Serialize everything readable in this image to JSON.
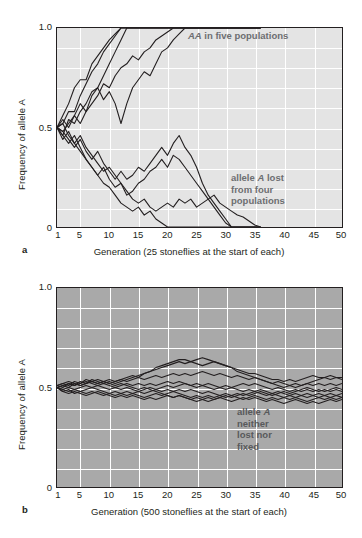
{
  "figure": {
    "panels": [
      {
        "letter": "a",
        "y_axis_label": "Frequency of allele A",
        "y_ticks": [
          "1.0",
          "0.5",
          "0"
        ],
        "x_caption": "Generation (25 stoneflies at the start of each)",
        "x_ticks": [
          "1",
          "5",
          "10",
          "15",
          "20",
          "25",
          "30",
          "35",
          "40",
          "45",
          "50"
        ],
        "annotations": [
          {
            "id": "fixed-note",
            "line1_italic": "AA",
            "line1_rest": " in five populations"
          },
          {
            "id": "lost-note",
            "line1_pre": "allele ",
            "line1_italic": "A",
            "line1_post": " lost",
            "line2": "from four",
            "line3": "populations"
          }
        ]
      },
      {
        "letter": "b",
        "y_axis_label": "Frequency of allele A",
        "y_ticks": [
          "1.0",
          "0.5",
          "0"
        ],
        "x_caption": "Generation (500 stoneflies at the start of each)",
        "x_ticks": [
          "1",
          "5",
          "10",
          "15",
          "20",
          "25",
          "30",
          "35",
          "40",
          "45",
          "50"
        ],
        "annotations": [
          {
            "id": "drift-note",
            "line1_pre": "allele ",
            "line1_italic": "A",
            "line2": "neither",
            "line3": "lost nor",
            "line4": "fixed"
          }
        ]
      }
    ],
    "colors": {
      "panel_a_background": "#e4e4e4",
      "panel_b_background": "#a9a9a9",
      "gridline": "#ffffff",
      "trajectory": "#231f20",
      "annotation_text": "#6d6e71",
      "axis": "#231f20"
    }
  },
  "chart_data": [
    {
      "type": "line",
      "panel": "a",
      "title": "",
      "xlabel": "Generation (25 stoneflies at the start of each)",
      "ylabel": "Frequency of allele A",
      "xlim": [
        1,
        50
      ],
      "ylim": [
        0,
        1.0
      ],
      "grid": true,
      "x_tick_values": [
        1,
        5,
        10,
        15,
        20,
        25,
        30,
        35,
        40,
        45,
        50
      ],
      "y_tick_values": [
        0,
        0.5,
        1.0
      ],
      "population_size": 25,
      "n_populations": 9,
      "outcome": "5 populations fixed for A, 4 populations lost A",
      "x": [
        1,
        2,
        3,
        4,
        5,
        6,
        7,
        8,
        9,
        10,
        11,
        12,
        13,
        14,
        15,
        16,
        17,
        18,
        19,
        20,
        21,
        22,
        23,
        24,
        25,
        26,
        27,
        28,
        29,
        30,
        31,
        32,
        33,
        34,
        35,
        36
      ],
      "series": [
        {
          "name": "pop1-fixed",
          "values": [
            0.5,
            0.56,
            0.62,
            0.7,
            0.74,
            0.74,
            0.82,
            0.86,
            0.9,
            0.94,
            0.97,
            1.0,
            1.0,
            1.0,
            1.0,
            1.0,
            1.0,
            1.0,
            1.0,
            1.0,
            1.0,
            1.0,
            1.0,
            1.0,
            1.0,
            1.0,
            1.0,
            1.0,
            1.0,
            1.0,
            1.0,
            1.0,
            1.0,
            1.0,
            1.0,
            1.0
          ]
        },
        {
          "name": "pop2-fixed",
          "values": [
            0.5,
            0.52,
            0.58,
            0.58,
            0.66,
            0.72,
            0.78,
            0.82,
            0.88,
            0.92,
            0.96,
            1.0,
            1.0,
            1.0,
            1.0,
            1.0,
            1.0,
            1.0,
            1.0,
            1.0,
            1.0,
            1.0,
            1.0,
            1.0,
            1.0,
            1.0,
            1.0,
            1.0,
            1.0,
            1.0,
            1.0,
            1.0,
            1.0,
            1.0,
            1.0,
            1.0
          ]
        },
        {
          "name": "pop3-fixed",
          "values": [
            0.5,
            0.46,
            0.54,
            0.52,
            0.58,
            0.62,
            0.68,
            0.7,
            0.76,
            0.82,
            0.88,
            0.94,
            1.0,
            1.0,
            1.0,
            1.0,
            1.0,
            1.0,
            1.0,
            1.0,
            1.0,
            1.0,
            1.0,
            1.0,
            1.0,
            1.0,
            1.0,
            1.0,
            1.0,
            1.0,
            1.0,
            1.0,
            1.0,
            1.0,
            1.0,
            1.0
          ]
        },
        {
          "name": "pop4-fixed",
          "values": [
            0.5,
            0.54,
            0.5,
            0.56,
            0.62,
            0.58,
            0.66,
            0.7,
            0.64,
            0.68,
            0.62,
            0.52,
            0.62,
            0.7,
            0.74,
            0.78,
            0.76,
            0.82,
            0.88,
            0.9,
            0.94,
            0.97,
            1.0,
            1.0,
            1.0,
            1.0,
            1.0,
            1.0,
            1.0,
            1.0,
            1.0,
            1.0,
            1.0,
            1.0,
            1.0,
            1.0
          ]
        },
        {
          "name": "pop5-fixed",
          "values": [
            0.5,
            0.48,
            0.52,
            0.56,
            0.52,
            0.58,
            0.62,
            0.66,
            0.72,
            0.7,
            0.76,
            0.8,
            0.82,
            0.86,
            0.84,
            0.88,
            0.9,
            0.94,
            0.96,
            0.98,
            1.0,
            1.0,
            1.0,
            1.0,
            1.0,
            1.0,
            1.0,
            1.0,
            1.0,
            1.0,
            1.0,
            1.0,
            1.0,
            1.0,
            1.0,
            1.0
          ]
        },
        {
          "name": "pop6-lost",
          "values": [
            0.5,
            0.44,
            0.48,
            0.42,
            0.38,
            0.34,
            0.3,
            0.26,
            0.22,
            0.2,
            0.16,
            0.12,
            0.1,
            0.08,
            0.1,
            0.06,
            0.08,
            0.04,
            0.02,
            0.0,
            0.0,
            0.0,
            0.0,
            0.0,
            0.0,
            0.0,
            0.0,
            0.0,
            0.0,
            0.0,
            0.0,
            0.0,
            0.0,
            0.0,
            0.0,
            0.0
          ]
        },
        {
          "name": "pop7-lost",
          "values": [
            0.5,
            0.46,
            0.42,
            0.46,
            0.4,
            0.34,
            0.3,
            0.26,
            0.3,
            0.24,
            0.2,
            0.22,
            0.16,
            0.18,
            0.22,
            0.24,
            0.28,
            0.3,
            0.34,
            0.3,
            0.36,
            0.34,
            0.3,
            0.26,
            0.22,
            0.18,
            0.14,
            0.1,
            0.06,
            0.02,
            0.0,
            0.0,
            0.0,
            0.0,
            0.0,
            0.0
          ]
        },
        {
          "name": "pop8-lost",
          "values": [
            0.5,
            0.48,
            0.44,
            0.4,
            0.44,
            0.38,
            0.34,
            0.38,
            0.32,
            0.28,
            0.24,
            0.28,
            0.24,
            0.26,
            0.3,
            0.28,
            0.32,
            0.36,
            0.4,
            0.36,
            0.42,
            0.46,
            0.4,
            0.36,
            0.3,
            0.22,
            0.16,
            0.12,
            0.08,
            0.04,
            0.0,
            0.0,
            0.0,
            0.0,
            0.0,
            0.0
          ]
        },
        {
          "name": "pop9-lost",
          "values": [
            0.5,
            0.52,
            0.46,
            0.42,
            0.46,
            0.4,
            0.36,
            0.32,
            0.28,
            0.3,
            0.26,
            0.22,
            0.18,
            0.14,
            0.12,
            0.14,
            0.1,
            0.08,
            0.1,
            0.12,
            0.1,
            0.14,
            0.12,
            0.14,
            0.1,
            0.12,
            0.14,
            0.16,
            0.12,
            0.1,
            0.08,
            0.06,
            0.05,
            0.03,
            0.01,
            0.0
          ]
        }
      ]
    },
    {
      "type": "line",
      "panel": "b",
      "title": "",
      "xlabel": "Generation (500 stoneflies at the start of each)",
      "ylabel": "Frequency of allele A",
      "xlim": [
        1,
        50
      ],
      "ylim": [
        0,
        1.0
      ],
      "grid": true,
      "x_tick_values": [
        1,
        5,
        10,
        15,
        20,
        25,
        30,
        35,
        40,
        45,
        50
      ],
      "y_tick_values": [
        0,
        0.5,
        1.0
      ],
      "population_size": 500,
      "n_populations": 9,
      "outcome": "allele A neither lost nor fixed in any population",
      "x": [
        1,
        2,
        3,
        4,
        5,
        6,
        7,
        8,
        9,
        10,
        11,
        12,
        13,
        14,
        15,
        16,
        17,
        18,
        19,
        20,
        21,
        22,
        23,
        24,
        25,
        26,
        27,
        28,
        29,
        30,
        31,
        32,
        33,
        34,
        35,
        36,
        37,
        38,
        39,
        40,
        41,
        42,
        43,
        44,
        45,
        46,
        47,
        48,
        49,
        50
      ],
      "series": [
        {
          "name": "popB1",
          "values": [
            0.51,
            0.52,
            0.51,
            0.53,
            0.52,
            0.54,
            0.53,
            0.52,
            0.53,
            0.54,
            0.53,
            0.54,
            0.55,
            0.56,
            0.55,
            0.57,
            0.58,
            0.6,
            0.61,
            0.62,
            0.63,
            0.64,
            0.64,
            0.63,
            0.64,
            0.65,
            0.64,
            0.63,
            0.62,
            0.61,
            0.6,
            0.59,
            0.58,
            0.57,
            0.57,
            0.56,
            0.55,
            0.54,
            0.54,
            0.53,
            0.54,
            0.53,
            0.54,
            0.55,
            0.56,
            0.55,
            0.55,
            0.56,
            0.55,
            0.55
          ]
        },
        {
          "name": "popB2",
          "values": [
            0.51,
            0.5,
            0.52,
            0.51,
            0.53,
            0.52,
            0.54,
            0.53,
            0.52,
            0.53,
            0.52,
            0.53,
            0.54,
            0.55,
            0.56,
            0.57,
            0.58,
            0.59,
            0.6,
            0.61,
            0.62,
            0.63,
            0.62,
            0.63,
            0.62,
            0.61,
            0.62,
            0.63,
            0.62,
            0.61,
            0.6,
            0.58,
            0.57,
            0.56,
            0.55,
            0.54,
            0.53,
            0.52,
            0.51,
            0.5,
            0.51,
            0.5,
            0.51,
            0.52,
            0.53,
            0.54,
            0.55,
            0.54,
            0.55,
            0.54
          ]
        },
        {
          "name": "popB3",
          "values": [
            0.5,
            0.51,
            0.5,
            0.52,
            0.51,
            0.52,
            0.53,
            0.52,
            0.53,
            0.52,
            0.53,
            0.54,
            0.53,
            0.54,
            0.55,
            0.54,
            0.55,
            0.56,
            0.55,
            0.56,
            0.57,
            0.56,
            0.57,
            0.56,
            0.57,
            0.58,
            0.57,
            0.56,
            0.57,
            0.56,
            0.55,
            0.56,
            0.55,
            0.54,
            0.55,
            0.54,
            0.53,
            0.52,
            0.53,
            0.52,
            0.51,
            0.52,
            0.51,
            0.52,
            0.51,
            0.52,
            0.51,
            0.52,
            0.51,
            0.52
          ]
        },
        {
          "name": "popB4",
          "values": [
            0.5,
            0.51,
            0.52,
            0.51,
            0.52,
            0.53,
            0.52,
            0.51,
            0.52,
            0.51,
            0.5,
            0.51,
            0.52,
            0.51,
            0.52,
            0.51,
            0.52,
            0.51,
            0.52,
            0.53,
            0.52,
            0.53,
            0.52,
            0.51,
            0.52,
            0.51,
            0.52,
            0.51,
            0.5,
            0.51,
            0.5,
            0.51,
            0.52,
            0.51,
            0.52,
            0.51,
            0.5,
            0.49,
            0.5,
            0.49,
            0.48,
            0.49,
            0.48,
            0.49,
            0.48,
            0.49,
            0.48,
            0.49,
            0.5,
            0.49
          ]
        },
        {
          "name": "popB5",
          "values": [
            0.5,
            0.49,
            0.5,
            0.49,
            0.5,
            0.51,
            0.5,
            0.51,
            0.5,
            0.49,
            0.5,
            0.49,
            0.5,
            0.49,
            0.48,
            0.49,
            0.5,
            0.49,
            0.5,
            0.51,
            0.5,
            0.51,
            0.52,
            0.51,
            0.5,
            0.51,
            0.5,
            0.49,
            0.5,
            0.49,
            0.5,
            0.49,
            0.48,
            0.49,
            0.48,
            0.49,
            0.48,
            0.47,
            0.48,
            0.47,
            0.46,
            0.47,
            0.46,
            0.47,
            0.46,
            0.47,
            0.46,
            0.47,
            0.46,
            0.47
          ]
        },
        {
          "name": "popB6",
          "values": [
            0.5,
            0.49,
            0.48,
            0.49,
            0.48,
            0.49,
            0.5,
            0.49,
            0.48,
            0.47,
            0.48,
            0.47,
            0.48,
            0.47,
            0.48,
            0.47,
            0.48,
            0.49,
            0.48,
            0.49,
            0.48,
            0.49,
            0.48,
            0.49,
            0.48,
            0.47,
            0.48,
            0.47,
            0.46,
            0.47,
            0.46,
            0.47,
            0.46,
            0.47,
            0.48,
            0.47,
            0.46,
            0.47,
            0.46,
            0.45,
            0.46,
            0.45,
            0.46,
            0.45,
            0.46,
            0.45,
            0.46,
            0.45,
            0.46,
            0.45
          ]
        },
        {
          "name": "popB7",
          "values": [
            0.5,
            0.48,
            0.49,
            0.47,
            0.48,
            0.47,
            0.48,
            0.47,
            0.46,
            0.47,
            0.46,
            0.47,
            0.46,
            0.47,
            0.46,
            0.45,
            0.46,
            0.47,
            0.46,
            0.47,
            0.48,
            0.47,
            0.46,
            0.45,
            0.46,
            0.45,
            0.46,
            0.45,
            0.46,
            0.45,
            0.46,
            0.45,
            0.44,
            0.45,
            0.46,
            0.45,
            0.44,
            0.45,
            0.44,
            0.45,
            0.44,
            0.45,
            0.44,
            0.43,
            0.44,
            0.45,
            0.44,
            0.45,
            0.44,
            0.45
          ]
        },
        {
          "name": "popB8",
          "values": [
            0.5,
            0.48,
            0.47,
            0.48,
            0.47,
            0.46,
            0.47,
            0.48,
            0.47,
            0.46,
            0.45,
            0.46,
            0.45,
            0.46,
            0.45,
            0.44,
            0.45,
            0.44,
            0.45,
            0.46,
            0.45,
            0.46,
            0.45,
            0.44,
            0.43,
            0.44,
            0.45,
            0.44,
            0.45,
            0.44,
            0.43,
            0.44,
            0.45,
            0.44,
            0.45,
            0.44,
            0.43,
            0.44,
            0.43,
            0.42,
            0.43,
            0.44,
            0.43,
            0.42,
            0.43,
            0.42,
            0.43,
            0.44,
            0.43,
            0.44
          ]
        },
        {
          "name": "popB9",
          "values": [
            0.51,
            0.52,
            0.53,
            0.52,
            0.51,
            0.52,
            0.53,
            0.54,
            0.53,
            0.52,
            0.51,
            0.52,
            0.51,
            0.5,
            0.49,
            0.5,
            0.49,
            0.48,
            0.47,
            0.46,
            0.45,
            0.46,
            0.45,
            0.44,
            0.45,
            0.44,
            0.43,
            0.44,
            0.45,
            0.46,
            0.45,
            0.46,
            0.47,
            0.46,
            0.47,
            0.48,
            0.47,
            0.46,
            0.47,
            0.48,
            0.47,
            0.48,
            0.49,
            0.5,
            0.49,
            0.48,
            0.49,
            0.48,
            0.49,
            0.48
          ]
        }
      ]
    }
  ]
}
